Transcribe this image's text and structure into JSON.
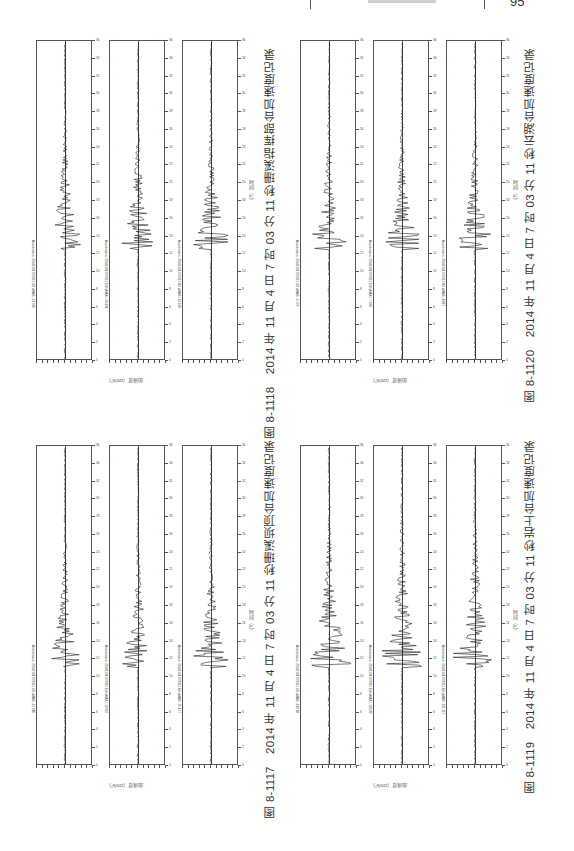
{
  "page": {
    "header": {
      "page_number": "95"
    },
    "orientation": "rotated-90",
    "figures": [
      {
        "id": "fig-8-1117",
        "caption": "图 8-1117　2014 年 11 月 4 日 7 时 03 分 11 秒珊溪坝顶台加速度记录",
        "x_axis_label": "时间（s）",
        "y_axis_label": "加速度（cm/s²）",
        "panels": [
          {
            "title": "Acceleration: 20141104 070311 UD  aMAX=-12.386"
          },
          {
            "title": "Acceleration: 20141104 070311 EW  aMAX=-13.967"
          },
          {
            "title": "Acceleration: 20141104 070311 NS  aMAX=-25.417"
          }
        ]
      },
      {
        "id": "fig-8-1118",
        "caption": "图 8-1118　2014 年 11 月 4 日 7 时 03 分 11 秒珊溪指挥部台加速度记录",
        "x_axis_label": "时间（s）",
        "y_axis_label": "加速度（cm/s²）",
        "panels": [
          {
            "title": "Acceleration: 20141104 070311 UD  aMAX=-13.965"
          },
          {
            "title": "Acceleration: 20141104 070311 EW  aMAX=-24.304"
          },
          {
            "title": "Acceleration: 20141104 070311 NS  aMAX=-14.138"
          }
        ]
      },
      {
        "id": "fig-8-1119",
        "caption": "图 8-1119　2014 年 11 月 4 日 7 时 03 分 11 秒岩上台加速度记录",
        "x_axis_label": "时间（s）",
        "y_axis_label": "加速度（cm/s²）",
        "panels": [
          {
            "title": "Acceleration: 20141104 070311 UD  aMAX=-130.68"
          },
          {
            "title": "Acceleration: 20141104 070311 EW  aMAX=-135.80"
          },
          {
            "title": "Acceleration: 20141104 070311 NS  aMAX=-161.117"
          }
        ]
      },
      {
        "id": "fig-8-1120",
        "caption": "图 8-1120　2014 年 11 月 4 日 7 时 03 分 11 秒云湖台加速度记录",
        "x_axis_label": "时间（s）",
        "y_axis_label": "加速度（cm/s²）",
        "panels": [
          {
            "title": "Acceleration: 20141104 070311 UD  aMAX=-5.722"
          },
          {
            "title": "Acceleration: 20141104 070311 EW  aMAX=-7.168"
          },
          {
            "title": "Acceleration: 20141104 070311 NS  aMAX=-8.867"
          }
        ]
      }
    ],
    "time_ticks": [
      "0",
      "2",
      "4",
      "6",
      "8",
      "10",
      "12",
      "14",
      "16",
      "18",
      "20",
      "22",
      "24",
      "26",
      "28",
      "30",
      "32",
      "34",
      "36"
    ]
  }
}
